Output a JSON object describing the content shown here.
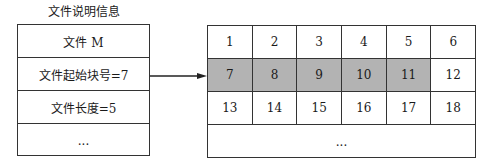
{
  "fcb": {
    "caption": "文件说明信息",
    "rows": [
      "文件 M",
      "文件起始块号=7",
      "文件长度=5",
      "..."
    ]
  },
  "arrow": {
    "from": "文件起始块号=7",
    "to": "7"
  },
  "disk": {
    "rows": [
      [
        {
          "label": "1",
          "allocated": false
        },
        {
          "label": "2",
          "allocated": false
        },
        {
          "label": "3",
          "allocated": false
        },
        {
          "label": "4",
          "allocated": false
        },
        {
          "label": "5",
          "allocated": false
        },
        {
          "label": "6",
          "allocated": false
        }
      ],
      [
        {
          "label": "7",
          "allocated": true
        },
        {
          "label": "8",
          "allocated": true
        },
        {
          "label": "9",
          "allocated": true
        },
        {
          "label": "10",
          "allocated": true
        },
        {
          "label": "11",
          "allocated": true
        },
        {
          "label": "12",
          "allocated": false
        }
      ],
      [
        {
          "label": "13",
          "allocated": false
        },
        {
          "label": "14",
          "allocated": false
        },
        {
          "label": "15",
          "allocated": false
        },
        {
          "label": "16",
          "allocated": false
        },
        {
          "label": "17",
          "allocated": false
        },
        {
          "label": "18",
          "allocated": false
        }
      ]
    ],
    "ellipsis": "...",
    "shade_color": "#b3b3b3"
  }
}
